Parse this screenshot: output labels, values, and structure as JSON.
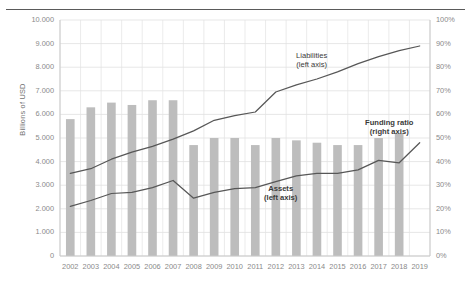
{
  "chart_data": {
    "type": "bar",
    "title": "",
    "subtitle": "",
    "xlabel": "",
    "ylabel": "Billions of USD",
    "ylabel_right": "",
    "grid": true,
    "legend_position": "inline-annotations",
    "categories": [
      "2002",
      "2003",
      "2004",
      "2005",
      "2006",
      "2007",
      "2008",
      "2009",
      "2010",
      "2011",
      "2012",
      "2013",
      "2014",
      "2015",
      "2016",
      "2017",
      "2018",
      "2019"
    ],
    "ylim": [
      0,
      10000
    ],
    "ylim_right": [
      0,
      100
    ],
    "yticks": [
      "0",
      "1.000",
      "2.000",
      "3.000",
      "4.000",
      "5.000",
      "6.000",
      "7.000",
      "8.000",
      "9.000",
      "10.000"
    ],
    "yticks_right": [
      "0%",
      "10%",
      "20%",
      "30%",
      "40%",
      "50%",
      "60%",
      "70%",
      "80%",
      "90%",
      "100%"
    ],
    "series": [
      {
        "name": "Funding ratio",
        "type": "bar",
        "axis": "right",
        "unit": "%",
        "color": "#bdbdbd",
        "values": [
          58,
          63,
          65,
          64,
          66,
          66,
          47,
          50,
          50,
          47,
          50,
          49,
          48,
          47,
          47,
          50,
          52,
          null
        ]
      },
      {
        "name": "Liabilities",
        "type": "line",
        "axis": "left",
        "unit": "Billions of USD",
        "color": "#575757",
        "values": [
          3500,
          3700,
          4100,
          4400,
          4650,
          4950,
          5300,
          5750,
          5950,
          6100,
          6950,
          7250,
          7500,
          7800,
          8150,
          8450,
          8700,
          8900
        ]
      },
      {
        "name": "Assets",
        "type": "line",
        "axis": "left",
        "unit": "Billions of USD",
        "color": "#575757",
        "values": [
          2100,
          2350,
          2650,
          2700,
          2900,
          3200,
          2450,
          2700,
          2850,
          2900,
          3150,
          3400,
          3500,
          3500,
          3650,
          4050,
          3950,
          4800
        ]
      }
    ],
    "annotations": [
      {
        "id": "liabilities-label",
        "line1": "Liabilities",
        "line2": "(left axis)",
        "bold": false
      },
      {
        "id": "assets-label",
        "line1": "Assets",
        "line2": "(left axis)",
        "bold": true
      },
      {
        "id": "funding-ratio-label",
        "line1": "Funding ratio",
        "line2": "(right axis)",
        "bold": true
      }
    ]
  }
}
